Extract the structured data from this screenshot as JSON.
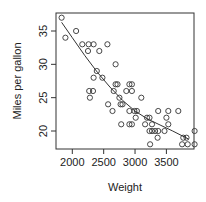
{
  "chart_data": {
    "type": "scatter",
    "title": "",
    "xlabel": "Weight",
    "ylabel": "Miles per gallon",
    "xlim": [
      1740,
      3940
    ],
    "ylim": [
      17.3,
      37.7
    ],
    "xticks": [
      2000,
      2500,
      3000,
      3500
    ],
    "yticks": [
      20,
      25,
      30,
      35
    ],
    "grid": false,
    "legend": "none",
    "series": [
      {
        "name": "cars",
        "marker": "open-circle",
        "points": [
          [
            1830,
            37
          ],
          [
            1890,
            34
          ],
          [
            2060,
            35
          ],
          [
            2160,
            33
          ],
          [
            2260,
            33
          ],
          [
            2340,
            33
          ],
          [
            2250,
            32
          ],
          [
            2430,
            32
          ],
          [
            2560,
            33
          ],
          [
            2690,
            30
          ],
          [
            2390,
            29
          ],
          [
            2480,
            28
          ],
          [
            2340,
            28
          ],
          [
            2270,
            26
          ],
          [
            2330,
            26
          ],
          [
            2280,
            25
          ],
          [
            2570,
            24
          ],
          [
            2640,
            23
          ],
          [
            2660,
            26
          ],
          [
            2690,
            27
          ],
          [
            2720,
            27
          ],
          [
            2750,
            25
          ],
          [
            2770,
            24
          ],
          [
            2800,
            24
          ],
          [
            2780,
            21
          ],
          [
            2860,
            26
          ],
          [
            2910,
            27
          ],
          [
            2950,
            27
          ],
          [
            2950,
            26
          ],
          [
            2910,
            23
          ],
          [
            2910,
            21
          ],
          [
            2950,
            21
          ],
          [
            2990,
            23
          ],
          [
            3030,
            23
          ],
          [
            3010,
            22
          ],
          [
            3100,
            25
          ],
          [
            3160,
            21
          ],
          [
            3190,
            22
          ],
          [
            3230,
            22
          ],
          [
            3230,
            20
          ],
          [
            3270,
            20
          ],
          [
            3240,
            18
          ],
          [
            3270,
            21
          ],
          [
            3320,
            20
          ],
          [
            3370,
            20
          ],
          [
            3360,
            19
          ],
          [
            3370,
            23
          ],
          [
            3470,
            20
          ],
          [
            3500,
            22
          ],
          [
            3530,
            23
          ],
          [
            3530,
            21
          ],
          [
            3690,
            23
          ],
          [
            3750,
            18
          ],
          [
            3840,
            18
          ],
          [
            3770,
            19
          ],
          [
            3820,
            19
          ],
          [
            3950,
            20
          ],
          [
            3950,
            18
          ]
        ]
      },
      {
        "name": "smooth-fit",
        "type": "line",
        "points": [
          [
            1830,
            36.3
          ],
          [
            2000,
            34.0
          ],
          [
            2200,
            31.3
          ],
          [
            2400,
            28.8
          ],
          [
            2600,
            26.6
          ],
          [
            2800,
            24.6
          ],
          [
            3000,
            23.0
          ],
          [
            3200,
            21.8
          ],
          [
            3400,
            20.9
          ],
          [
            3600,
            20.0
          ],
          [
            3850,
            18.8
          ]
        ]
      }
    ]
  }
}
